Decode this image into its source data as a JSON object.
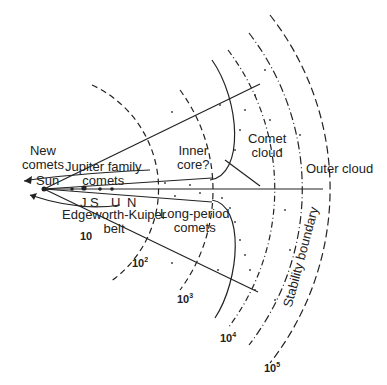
{
  "diagram": {
    "labels": {
      "new_comets": [
        "New",
        "comets"
      ],
      "jupiter_family": [
        "Jupiter family",
        "comets"
      ],
      "sun": "Sun",
      "planets": [
        "J",
        "S",
        "U",
        "N"
      ],
      "edgeworth_kuiper": [
        "Edgeworth-Kuiper",
        "belt"
      ],
      "inner_core": [
        "Inner",
        "core?"
      ],
      "comet_cloud": [
        "Comet",
        "cloud"
      ],
      "long_period": [
        "Long-period",
        "comets"
      ],
      "outer_cloud": "Outer cloud",
      "stability_boundary": "Stability boundary"
    },
    "distance_markers": [
      {
        "base": "10",
        "exp": ""
      },
      {
        "base": "10",
        "exp": "2"
      },
      {
        "base": "10",
        "exp": "3"
      },
      {
        "base": "10",
        "exp": "4"
      },
      {
        "base": "10",
        "exp": "5"
      }
    ],
    "colors": {
      "line": "#222222",
      "background": "#ffffff"
    }
  }
}
